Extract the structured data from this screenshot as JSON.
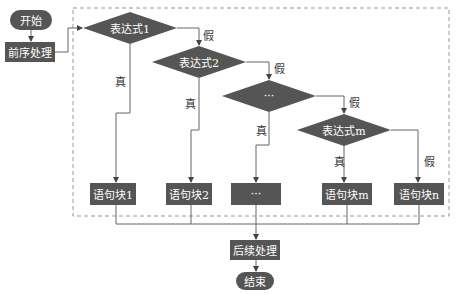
{
  "colors": {
    "node_fill": "#555555",
    "node_text": "#ffffff",
    "line": "#666666",
    "dashed_border": "#999999",
    "label_text": "#333333"
  },
  "nodes": {
    "start": "开始",
    "pre": "前序处理",
    "expr1": "表达式1",
    "expr2": "表达式2",
    "expr_dots": "···",
    "exprm": "表达式m",
    "block1": "语句块1",
    "block2": "语句块2",
    "block_dots": "···",
    "blockm": "语句块m",
    "blockn": "语句块n",
    "post": "后续处理",
    "end": "结束"
  },
  "edge_labels": {
    "true1": "真",
    "false1": "假",
    "true2": "真",
    "false2": "假",
    "true3": "真",
    "false3": "假",
    "truem": "真",
    "falsem": "假"
  }
}
